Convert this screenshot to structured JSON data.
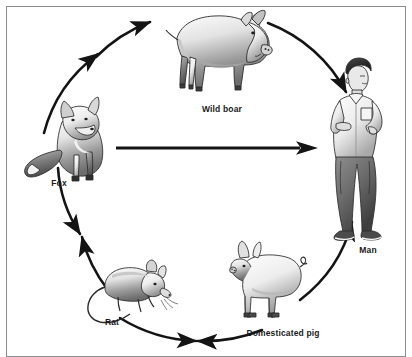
{
  "figure": {
    "background_color": "#ffffff",
    "border_color": "#8a8d90",
    "ink_color": "#1a1a1a"
  },
  "diagram": {
    "type": "cycle",
    "shape": "circular arrow ring with one central straight arrow",
    "nodes": [
      {
        "id": "wild-boar",
        "label": "Wild boar",
        "position": "top",
        "label_x": 222,
        "label_y": 110,
        "art": "boar-illustration"
      },
      {
        "id": "man",
        "label": "Man",
        "position": "right",
        "label_x": 368,
        "label_y": 250,
        "art": "man-illustration"
      },
      {
        "id": "domesticated-pig",
        "label": "Domesticated pig",
        "position": "bottom-right",
        "label_x": 283,
        "label_y": 334,
        "art": "pig-illustration"
      },
      {
        "id": "rat",
        "label": "Rat",
        "position": "bottom-left",
        "label_x": 112,
        "label_y": 322,
        "art": "rat-illustration"
      },
      {
        "id": "fox",
        "label": "Fox",
        "position": "left",
        "label_x": 59,
        "label_y": 183,
        "art": "fox-illustration"
      }
    ],
    "edges": [
      {
        "id": "fox-to-boar",
        "from": "fox",
        "to": "wild-boar",
        "style": "curved-arc",
        "arrowheads": 2,
        "direction": "clockwise"
      },
      {
        "id": "boar-to-man",
        "from": "wild-boar",
        "to": "man",
        "style": "curved-arc",
        "arrowheads": 1,
        "direction": "clockwise"
      },
      {
        "id": "pig-to-man",
        "from": "domesticated-pig",
        "to": "man",
        "style": "curved-arc",
        "arrowheads": 1,
        "direction": "counter-clockwise"
      },
      {
        "id": "rat-to-pig",
        "from": "rat",
        "to": "domesticated-pig",
        "style": "curved-arc",
        "arrowheads": 2,
        "direction": "bidirectional"
      },
      {
        "id": "fox-rat",
        "from": "fox",
        "to": "rat",
        "style": "curved-arc",
        "arrowheads": 2,
        "direction": "bidirectional"
      },
      {
        "id": "fox-to-man",
        "from": "fox",
        "to": "man",
        "style": "straight",
        "arrowheads": 1,
        "direction": "left-to-right"
      }
    ]
  }
}
